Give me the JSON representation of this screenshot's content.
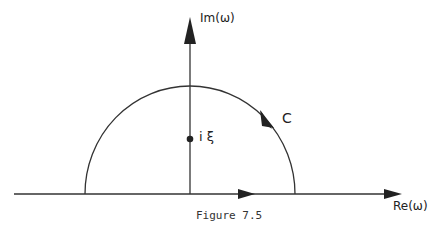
{
  "figure": {
    "caption": "Figure 7.5",
    "axes": {
      "imaginary_label": "Im(ω)",
      "real_label": "Re(ω)"
    },
    "point_label": "i ξ",
    "contour_label": "C",
    "colors": {
      "stroke": "#222222",
      "background": "#ffffff"
    }
  }
}
